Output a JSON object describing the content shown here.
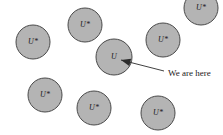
{
  "diagram": {
    "canvas": {
      "width": 223,
      "height": 135
    },
    "colors": {
      "background": "#ffffff",
      "circle_fill": "#b4b4b4",
      "circle_stroke": "#4a4a4a",
      "label_color": "#1a1a1a",
      "annotation_color": "#1a1a1a",
      "arrow_color": "#2b2b2b"
    },
    "universes": [
      {
        "id": "universe-top-left",
        "label": "U*",
        "cx": 33,
        "cy": 42,
        "r": 17
      },
      {
        "id": "universe-top-center",
        "label": "U*",
        "cx": 85,
        "cy": 25,
        "r": 17
      },
      {
        "id": "universe-top-right",
        "label": "U*",
        "cx": 163,
        "cy": 40,
        "r": 17
      },
      {
        "id": "universe-center-here",
        "label": "U",
        "cx": 114,
        "cy": 57,
        "r": 18
      },
      {
        "id": "universe-bottom-left",
        "label": "U*",
        "cx": 45,
        "cy": 95,
        "r": 17
      },
      {
        "id": "universe-bottom-center",
        "label": "U*",
        "cx": 94,
        "cy": 108,
        "r": 17
      },
      {
        "id": "universe-bottom-right",
        "label": "U*",
        "cx": 158,
        "cy": 113,
        "r": 17
      },
      {
        "id": "universe-mid-right",
        "label": "U*",
        "cx": 201,
        "cy": 8,
        "r": 17
      }
    ],
    "annotation": {
      "text": "We are here",
      "text_x": 168,
      "text_y": 74,
      "arrow": {
        "tail_x": 164,
        "tail_y": 71,
        "head_x": 121,
        "head_y": 60,
        "head_size": 5
      }
    }
  }
}
